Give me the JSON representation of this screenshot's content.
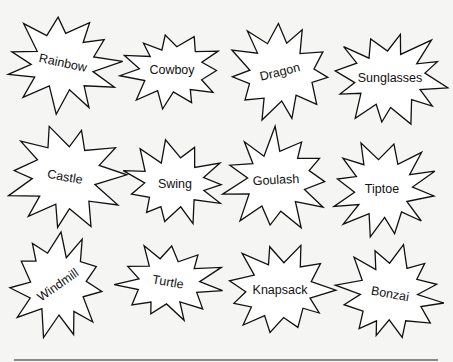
{
  "words": [
    {
      "label": "Rainbow",
      "cx": 63,
      "cy": 63,
      "rot": 12,
      "rx": 58,
      "ry": 50,
      "points": 11,
      "seed": 1
    },
    {
      "label": "Cowboy",
      "cx": 172,
      "cy": 70,
      "rot": 0,
      "rx": 54,
      "ry": 42,
      "points": 11,
      "seed": 2
    },
    {
      "label": "Dragon",
      "cx": 280,
      "cy": 72,
      "rot": -14,
      "rx": 56,
      "ry": 52,
      "points": 11,
      "seed": 3
    },
    {
      "label": "Sunglasses",
      "cx": 390,
      "cy": 78,
      "rot": 0,
      "rx": 62,
      "ry": 50,
      "points": 12,
      "seed": 4
    },
    {
      "label": "Castle",
      "cx": 65,
      "cy": 177,
      "rot": 10,
      "rx": 60,
      "ry": 55,
      "points": 11,
      "seed": 5
    },
    {
      "label": "Swing",
      "cx": 175,
      "cy": 184,
      "rot": 0,
      "rx": 55,
      "ry": 44,
      "points": 11,
      "seed": 6
    },
    {
      "label": "Goulash",
      "cx": 276,
      "cy": 180,
      "rot": -3,
      "rx": 56,
      "ry": 52,
      "points": 11,
      "seed": 7
    },
    {
      "label": "Tiptoe",
      "cx": 382,
      "cy": 189,
      "rot": 0,
      "rx": 55,
      "ry": 50,
      "points": 12,
      "seed": 8
    },
    {
      "label": "Windmill",
      "cx": 58,
      "cy": 285,
      "rot": -35,
      "rx": 50,
      "ry": 55,
      "points": 11,
      "seed": 9
    },
    {
      "label": "Turtle",
      "cx": 168,
      "cy": 282,
      "rot": 10,
      "rx": 55,
      "ry": 40,
      "points": 11,
      "seed": 10
    },
    {
      "label": "Knapsack",
      "cx": 280,
      "cy": 290,
      "rot": 0,
      "rx": 58,
      "ry": 48,
      "points": 11,
      "seed": 11
    },
    {
      "label": "Bonzai",
      "cx": 390,
      "cy": 294,
      "rot": 10,
      "rx": 55,
      "ry": 50,
      "points": 12,
      "seed": 12
    }
  ],
  "footer_rule": {
    "x1": 14,
    "x2": 438,
    "y": 360
  },
  "colors": {
    "background": "#f5f5f3",
    "fill": "#ffffff",
    "stroke": "#111111"
  }
}
